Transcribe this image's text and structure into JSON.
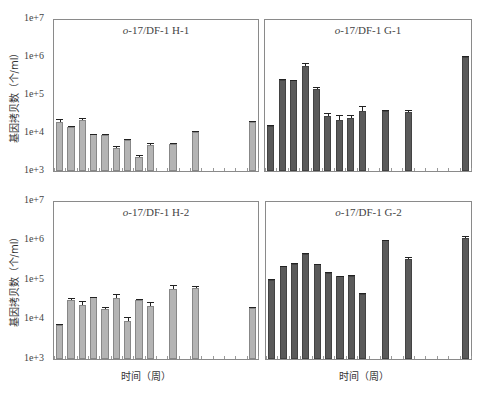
{
  "chart_data": [
    {
      "type": "bar",
      "title": "o-17/DF-1 H-1",
      "xlabel": "",
      "ylabel": "基因拷贝数（个/ml）",
      "yscale": "log",
      "ylim": [
        1000,
        10000000
      ],
      "yticks": [
        "1e+3",
        "1e+4",
        "1e+5",
        "1e+6",
        "1e+7"
      ],
      "num_slots": 18,
      "bar_color": "#b4b4b4",
      "slots": [
        0,
        1,
        2,
        3,
        4,
        5,
        6,
        7,
        8,
        10,
        12,
        17
      ],
      "values": [
        20000,
        15000,
        22000,
        9500,
        9200,
        4000,
        6500,
        2400,
        4800,
        5300,
        11000,
        20000
      ],
      "errors_high": [
        24000,
        15500,
        26000,
        9800,
        9500,
        4500,
        7000,
        2600,
        5400,
        5600,
        11500,
        21000
      ]
    },
    {
      "type": "bar",
      "title": "o-17/DF-1 G-1",
      "xlabel": "",
      "ylabel": "",
      "yscale": "log",
      "ylim": [
        1000,
        10000000
      ],
      "num_slots": 18,
      "bar_color": "#5a5a5a",
      "slots": [
        0,
        1,
        2,
        3,
        4,
        5,
        6,
        7,
        8,
        10,
        12,
        17
      ],
      "values": [
        16000,
        250000,
        250000,
        600000,
        150000,
        28000,
        22000,
        25000,
        40000,
        40000,
        36000,
        1050000
      ],
      "errors_high": [
        17000,
        270000,
        255000,
        730000,
        165000,
        34000,
        31000,
        31000,
        52000,
        41000,
        41000,
        1100000
      ]
    },
    {
      "type": "bar",
      "title": "o-17/DF-1 H-2",
      "xlabel": "时间（周）",
      "ylabel": "基因拷贝数（个/ml）",
      "yscale": "log",
      "ylim": [
        1000,
        10000000
      ],
      "yticks": [
        "1e+3",
        "1e+4",
        "1e+5",
        "1e+6",
        "1e+7"
      ],
      "num_slots": 18,
      "bar_color": "#b4b4b4",
      "slots": [
        0,
        1,
        2,
        3,
        4,
        5,
        6,
        7,
        8,
        10,
        12,
        17
      ],
      "values": [
        7500,
        32000,
        24000,
        37000,
        19000,
        35000,
        9500,
        32000,
        23000,
        62000,
        64000,
        20000
      ],
      "errors_high": [
        8000,
        35000,
        30000,
        38000,
        21000,
        44000,
        11500,
        34000,
        28500,
        78000,
        73000,
        21000
      ]
    },
    {
      "type": "bar",
      "title": "o-17/DF-1 G-2",
      "xlabel": "时间（周）",
      "ylabel": "",
      "yscale": "log",
      "ylim": [
        1000,
        10000000
      ],
      "num_slots": 18,
      "bar_color": "#5a5a5a",
      "slots": [
        0,
        1,
        2,
        3,
        4,
        5,
        6,
        7,
        8,
        10,
        12,
        17
      ],
      "values": [
        105000,
        230000,
        260000,
        480000,
        260000,
        160000,
        130000,
        130000,
        46000,
        1050000,
        360000,
        1200000
      ],
      "errors_high": [
        108000,
        240000,
        275000,
        500000,
        270000,
        168000,
        134000,
        135000,
        48000,
        1100000,
        390000,
        1350000
      ]
    }
  ],
  "panels": [
    {
      "title_prefix": "o",
      "title_rest": "-17/DF-1 H-1"
    },
    {
      "title_prefix": "o",
      "title_rest": "-17/DF-1 G-1"
    },
    {
      "title_prefix": "o",
      "title_rest": "-17/DF-1 H-2"
    },
    {
      "title_prefix": "o",
      "title_rest": "-17/DF-1 G-2"
    }
  ],
  "axis": {
    "yticks": [
      "1e+7",
      "1e+6",
      "1e+5",
      "1e+4",
      "1e+3"
    ],
    "ylabel": "基因拷贝数（个/ml）",
    "xlabel": "时间（周）"
  }
}
